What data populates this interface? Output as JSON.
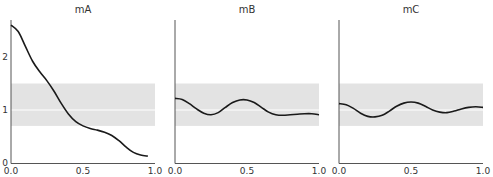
{
  "chart_data": [
    {
      "type": "line",
      "title": "mA",
      "xlabel": "",
      "ylabel": "",
      "xlim": [
        0,
        1
      ],
      "ylim": [
        0,
        2.7
      ],
      "xticks": [
        "0.0",
        "0.5",
        "1.0"
      ],
      "yticks": [
        "0",
        "1",
        "2"
      ],
      "band": {
        "low": 0.7,
        "high": 1.5,
        "center_line": 1.0
      },
      "x": [
        0.0,
        0.05,
        0.1,
        0.15,
        0.2,
        0.25,
        0.3,
        0.35,
        0.4,
        0.45,
        0.5,
        0.55,
        0.6,
        0.65,
        0.7,
        0.75,
        0.8,
        0.85,
        0.9,
        0.95
      ],
      "y": [
        2.6,
        2.48,
        2.2,
        1.92,
        1.72,
        1.55,
        1.35,
        1.12,
        0.92,
        0.78,
        0.7,
        0.65,
        0.62,
        0.58,
        0.52,
        0.42,
        0.3,
        0.2,
        0.15,
        0.13
      ]
    },
    {
      "type": "line",
      "title": "mB",
      "xlabel": "",
      "ylabel": "",
      "xlim": [
        0,
        1
      ],
      "ylim": [
        0,
        2.7
      ],
      "xticks": [
        "0.0",
        "0.5",
        "1.0"
      ],
      "yticks": [],
      "band": {
        "low": 0.7,
        "high": 1.5,
        "center_line": 1.0
      },
      "x": [
        0.0,
        0.05,
        0.1,
        0.15,
        0.2,
        0.25,
        0.3,
        0.35,
        0.4,
        0.45,
        0.5,
        0.55,
        0.6,
        0.65,
        0.7,
        0.75,
        0.8,
        0.85,
        0.9,
        0.95,
        1.0
      ],
      "y": [
        1.22,
        1.2,
        1.12,
        1.02,
        0.94,
        0.91,
        0.95,
        1.05,
        1.14,
        1.19,
        1.19,
        1.14,
        1.05,
        0.96,
        0.91,
        0.9,
        0.91,
        0.92,
        0.93,
        0.93,
        0.91
      ]
    },
    {
      "type": "line",
      "title": "mC",
      "xlabel": "",
      "ylabel": "",
      "xlim": [
        0,
        1
      ],
      "ylim": [
        0,
        2.7
      ],
      "xticks": [
        "0.0",
        "0.5",
        "1.0"
      ],
      "yticks": [],
      "band": {
        "low": 0.7,
        "high": 1.5,
        "center_line": 1.0
      },
      "x": [
        0.0,
        0.05,
        0.1,
        0.15,
        0.2,
        0.25,
        0.3,
        0.35,
        0.4,
        0.45,
        0.5,
        0.55,
        0.6,
        0.65,
        0.7,
        0.75,
        0.8,
        0.85,
        0.9,
        0.95,
        1.0
      ],
      "y": [
        1.12,
        1.1,
        1.03,
        0.94,
        0.88,
        0.87,
        0.9,
        0.98,
        1.07,
        1.13,
        1.15,
        1.13,
        1.07,
        1.0,
        0.96,
        0.95,
        0.98,
        1.02,
        1.05,
        1.06,
        1.05
      ]
    }
  ],
  "style": {
    "line_color": "#1a1a1a",
    "band_color": "#e3e3e3",
    "center_line_color": "#ffffff",
    "axis_color": "#555555"
  },
  "layout": {
    "panels": [
      {
        "left": 11,
        "right": 155
      },
      {
        "left": 175,
        "right": 319
      },
      {
        "left": 339,
        "right": 483
      }
    ],
    "y_zero_px": 163,
    "px_per_unit": 53,
    "axis_top_px": 20
  }
}
